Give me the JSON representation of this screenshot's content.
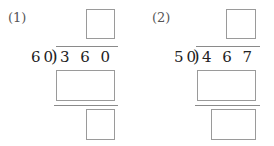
{
  "problems": [
    {
      "label": "(1)",
      "divisor": "60",
      "bracket": ")",
      "dividend": "3 6 0",
      "answer_boxes": [
        "quotient",
        "product",
        "remainder"
      ]
    },
    {
      "label": "(2)",
      "divisor": "50",
      "bracket": ")",
      "dividend": "4 6 7",
      "answer_boxes": [
        "quotient",
        "product",
        "remainder"
      ]
    }
  ]
}
